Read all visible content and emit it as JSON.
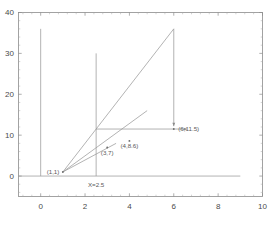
{
  "chart_data": {
    "type": "line",
    "title": "",
    "xlabel": "",
    "ylabel": "",
    "xlim": [
      -1,
      10
    ],
    "ylim": [
      -5,
      40
    ],
    "grid": false,
    "legend": null,
    "xticks": [
      0,
      2,
      4,
      6,
      8,
      10
    ],
    "xtick_labels": [
      "0",
      "2",
      "4",
      "6",
      "8",
      "10"
    ],
    "yticks": [
      0,
      10,
      20,
      30,
      40
    ],
    "ytick_labels": [
      "0",
      "10",
      "20",
      "30",
      "40"
    ],
    "series": [
      {
        "name": "vertical-line-x0",
        "type": "line",
        "points": [
          [
            0,
            0
          ],
          [
            0,
            36
          ]
        ]
      },
      {
        "name": "vertical-line-x2p5",
        "type": "line",
        "points": [
          [
            2.5,
            0
          ],
          [
            2.5,
            30
          ]
        ]
      },
      {
        "name": "horizontal-axis-line-y0",
        "type": "line",
        "points": [
          [
            -1,
            0
          ],
          [
            9,
            0
          ]
        ]
      },
      {
        "name": "ray-steep-to-6-36",
        "type": "line",
        "points": [
          [
            1,
            1
          ],
          [
            6,
            36
          ]
        ]
      },
      {
        "name": "ray-mid-to-4p8-16",
        "type": "line",
        "points": [
          [
            1,
            1
          ],
          [
            4.8,
            16
          ]
        ]
      },
      {
        "name": "ray-shallow-to-3p4-8",
        "type": "line",
        "points": [
          [
            1,
            1
          ],
          [
            3.4,
            8
          ]
        ]
      },
      {
        "name": "horizontal-arrow-to-6-11p5",
        "type": "arrow",
        "points": [
          [
            2.5,
            11.5
          ],
          [
            6.6,
            11.5
          ]
        ]
      },
      {
        "name": "vertical-arrow-down-at-x6",
        "type": "arrow",
        "points": [
          [
            6,
            36
          ],
          [
            6,
            12.2
          ]
        ]
      }
    ],
    "points": [
      {
        "label": "(1,1)",
        "x": 1,
        "y": 1,
        "label_pos": "left"
      },
      {
        "label": "(3,7)",
        "x": 3,
        "y": 7,
        "label_pos": "below"
      },
      {
        "label": "(4,8.6)",
        "x": 4,
        "y": 8.6,
        "label_pos": "below"
      },
      {
        "label": "(6,11.5)",
        "x": 6,
        "y": 11.5,
        "label_pos": "right"
      }
    ],
    "annotations": [
      {
        "text": "X=2.5",
        "x": 2.5,
        "y": -2.6,
        "name": "x-equals-2p5-label"
      }
    ]
  }
}
